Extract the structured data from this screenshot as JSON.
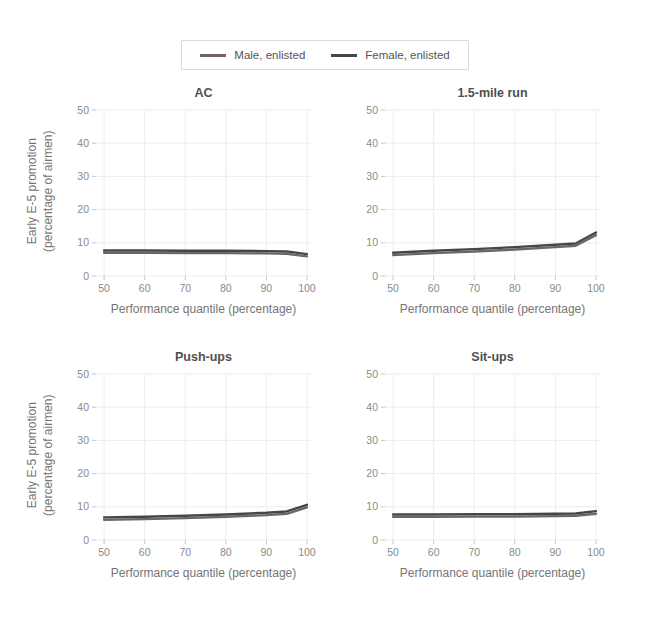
{
  "page": {
    "background": "#ffffff"
  },
  "legend": {
    "items": [
      {
        "label": "Male, enlisted",
        "color": "#6f6662"
      },
      {
        "label": "Female, enlisted",
        "color": "#45454d"
      }
    ]
  },
  "axes": {
    "y_label_line1": "Early E-5 promotion",
    "y_label_line2": "(percentage of airmen)",
    "x_label": "Performance quantile (percentage)"
  },
  "style": {
    "gridline_color": "#ececec",
    "tick_mark_color": "#c6c6c6",
    "tick_label_color": "#8a8a8a",
    "line_width": 2.4
  },
  "chart_data": [
    {
      "type": "line",
      "title": "AC",
      "xlabel": "Performance quantile (percentage)",
      "ylabel": "Early E-5 promotion (percentage of airmen)",
      "x": [
        50,
        60,
        70,
        80,
        90,
        95,
        100
      ],
      "series": [
        {
          "name": "Female, enlisted",
          "color": "#45454d",
          "values": [
            7.7,
            7.7,
            7.6,
            7.6,
            7.5,
            7.4,
            6.6
          ]
        },
        {
          "name": "Male, enlisted",
          "color": "#6f6662",
          "values": [
            7.0,
            7.0,
            6.9,
            6.9,
            6.8,
            6.7,
            5.9
          ]
        }
      ],
      "xlim": [
        48,
        101
      ],
      "ylim": [
        0,
        50
      ],
      "xticks": [
        50,
        60,
        70,
        80,
        90,
        100
      ],
      "yticks": [
        0,
        10,
        20,
        30,
        40,
        50
      ],
      "grid": true,
      "legend_position": "top-center"
    },
    {
      "type": "line",
      "title": "1.5-mile run",
      "xlabel": "Performance quantile (percentage)",
      "ylabel": "Early E-5 promotion (percentage of airmen)",
      "x": [
        50,
        60,
        70,
        80,
        90,
        95,
        100
      ],
      "series": [
        {
          "name": "Female, enlisted",
          "color": "#45454d",
          "values": [
            7.0,
            7.6,
            8.1,
            8.7,
            9.4,
            9.8,
            13.1
          ]
        },
        {
          "name": "Male, enlisted",
          "color": "#6f6662",
          "values": [
            6.3,
            6.9,
            7.4,
            8.0,
            8.7,
            9.1,
            12.3
          ]
        }
      ],
      "xlim": [
        48,
        101
      ],
      "ylim": [
        0,
        50
      ],
      "xticks": [
        50,
        60,
        70,
        80,
        90,
        100
      ],
      "yticks": [
        0,
        10,
        20,
        30,
        40,
        50
      ],
      "grid": true,
      "legend_position": "top-center"
    },
    {
      "type": "line",
      "title": "Push-ups",
      "xlabel": "Performance quantile (percentage)",
      "ylabel": "Early E-5 promotion (percentage of airmen)",
      "x": [
        50,
        60,
        70,
        80,
        90,
        95,
        100
      ],
      "series": [
        {
          "name": "Female, enlisted",
          "color": "#45454d",
          "values": [
            6.8,
            7.0,
            7.3,
            7.7,
            8.2,
            8.6,
            10.6
          ]
        },
        {
          "name": "Male, enlisted",
          "color": "#6f6662",
          "values": [
            6.1,
            6.3,
            6.6,
            7.0,
            7.5,
            7.9,
            9.8
          ]
        }
      ],
      "xlim": [
        48,
        101
      ],
      "ylim": [
        0,
        50
      ],
      "xticks": [
        50,
        60,
        70,
        80,
        90,
        100
      ],
      "yticks": [
        0,
        10,
        20,
        30,
        40,
        50
      ],
      "grid": true,
      "legend_position": "top-center"
    },
    {
      "type": "line",
      "title": "Sit-ups",
      "xlabel": "Performance quantile (percentage)",
      "ylabel": "Early E-5 promotion (percentage of airmen)",
      "x": [
        50,
        60,
        70,
        80,
        90,
        95,
        100
      ],
      "series": [
        {
          "name": "Female, enlisted",
          "color": "#45454d",
          "values": [
            7.7,
            7.7,
            7.8,
            7.8,
            7.9,
            8.0,
            8.7
          ]
        },
        {
          "name": "Male, enlisted",
          "color": "#6f6662",
          "values": [
            7.0,
            7.0,
            7.1,
            7.1,
            7.2,
            7.3,
            7.9
          ]
        }
      ],
      "xlim": [
        48,
        101
      ],
      "ylim": [
        0,
        50
      ],
      "xticks": [
        50,
        60,
        70,
        80,
        90,
        100
      ],
      "yticks": [
        0,
        10,
        20,
        30,
        40,
        50
      ],
      "grid": true,
      "legend_position": "top-center"
    }
  ]
}
